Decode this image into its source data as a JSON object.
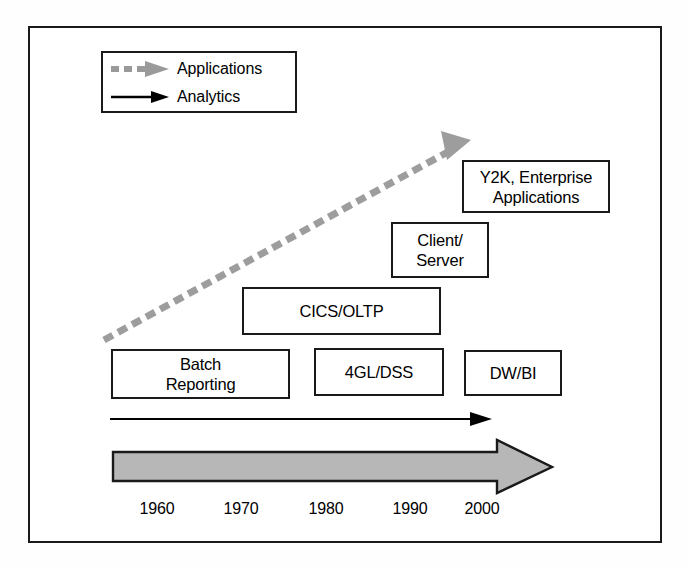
{
  "diagram": {
    "frame": {
      "border_color": "#1a1a1a"
    },
    "legend": {
      "items": [
        {
          "label": "Applications",
          "glyph": "dashed-arrow-icon",
          "color": "#9a9a9a",
          "style": "dashed"
        },
        {
          "label": "Analytics",
          "glyph": "solid-arrow-icon",
          "color": "#000000",
          "style": "solid"
        }
      ]
    },
    "boxes": [
      {
        "id": "y2k",
        "text": "Y2K, Enterprise\nApplications",
        "lines": [
          "Y2K, Enterprise",
          "Applications"
        ]
      },
      {
        "id": "client",
        "text": "Client/\nServer",
        "lines": [
          "Client/",
          "Server"
        ]
      },
      {
        "id": "cics",
        "text": "CICS/OLTP",
        "lines": [
          "CICS/OLTP"
        ]
      },
      {
        "id": "batch",
        "text": "Batch\nReporting",
        "lines": [
          "Batch",
          "Reporting"
        ]
      },
      {
        "id": "fourgl",
        "text": "4GL/DSS",
        "lines": [
          "4GL/DSS"
        ]
      },
      {
        "id": "dwbi",
        "text": "DW/BI",
        "lines": [
          "DW/BI"
        ]
      }
    ],
    "axis": {
      "ticks": [
        "1960",
        "1970",
        "1980",
        "1990",
        "2000"
      ],
      "timeline_arrow": {
        "fill": "#b5b5b5",
        "stroke": "#1a1a1a",
        "direction": "right"
      }
    },
    "analytics_arrow": {
      "color": "#000000",
      "direction": "right"
    },
    "applications_arrow": {
      "color": "#9a9a9a",
      "direction": "up-right",
      "style": "dashed"
    }
  }
}
